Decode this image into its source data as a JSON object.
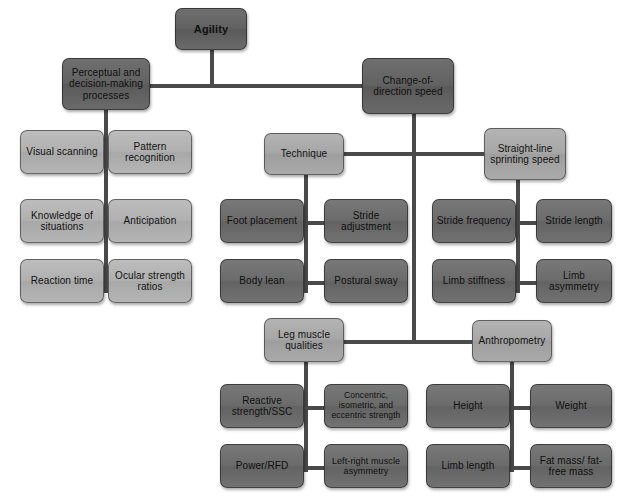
{
  "diagram": {
    "colors": {
      "line": "#4a4a4a",
      "root_fill": "#636363",
      "branch_fill": "#a6a6a6",
      "leaf_dark_fill": "#6b6b6b",
      "leaf_light_fill": "#b0b0b0",
      "background": "#ffffff",
      "text": "#101010"
    },
    "nodes": {
      "root": "Agility",
      "perceptual": "Perceptual and decision-making processes",
      "cod_speed": "Change-of-direction speed",
      "visual_scanning": "Visual scanning",
      "pattern_recognition": "Pattern recognition",
      "knowledge_of_situations": "Knowledge of situations",
      "anticipation": "Anticipation",
      "reaction_time": "Reaction time",
      "ocular_strength_ratios": "Ocular strength ratios",
      "technique": "Technique",
      "straight_line": "Straight-line sprinting speed",
      "foot_placement": "Foot placement",
      "stride_adjustment": "Stride adjustment",
      "body_lean": "Body lean",
      "postural_sway": "Postural sway",
      "stride_frequency": "Stride frequency",
      "stride_length": "Stride length",
      "limb_stiffness": "Limb stiffness",
      "limb_asymmetry": "Limb asymmetry",
      "leg_muscle_qualities": "Leg muscle qualities",
      "anthropometry": "Anthropometry",
      "reactive_strength": "Reactive strength/SSC",
      "concentric_isometric_eccentric": "Concentric, isometric, and eccentric strength",
      "power_rfd": "Power/RFD",
      "left_right_asymmetry": "Left-right muscle asymmetry",
      "height": "Height",
      "weight": "Weight",
      "limb_length": "Limb length",
      "fat_mass": "Fat mass/ fat-free mass"
    }
  }
}
